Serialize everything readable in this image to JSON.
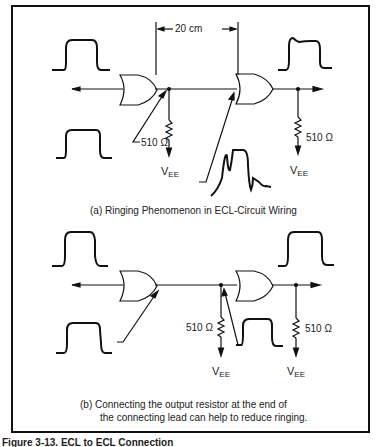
{
  "diagram": {
    "panel_a": {
      "dimension_label": "20 cm",
      "resistor_left": "510 Ω",
      "resistor_right": "510 Ω",
      "supply_left": {
        "main": "V",
        "sub": "EE"
      },
      "supply_right": {
        "main": "V",
        "sub": "EE"
      },
      "caption": "(a)  Ringing Phenomenon in ECL-Circuit Wiring"
    },
    "panel_b": {
      "resistor_left": "510 Ω",
      "resistor_right": "510 Ω",
      "supply_left": {
        "main": "V",
        "sub": "EE"
      },
      "supply_right": {
        "main": "V",
        "sub": "EE"
      },
      "caption_line1": "(b)  Connecting the output resistor at the end of",
      "caption_line2": "the connecting lead can help to reduce ringing."
    },
    "figure_caption": "Figure 3-13.  ECL to ECL Connection"
  }
}
